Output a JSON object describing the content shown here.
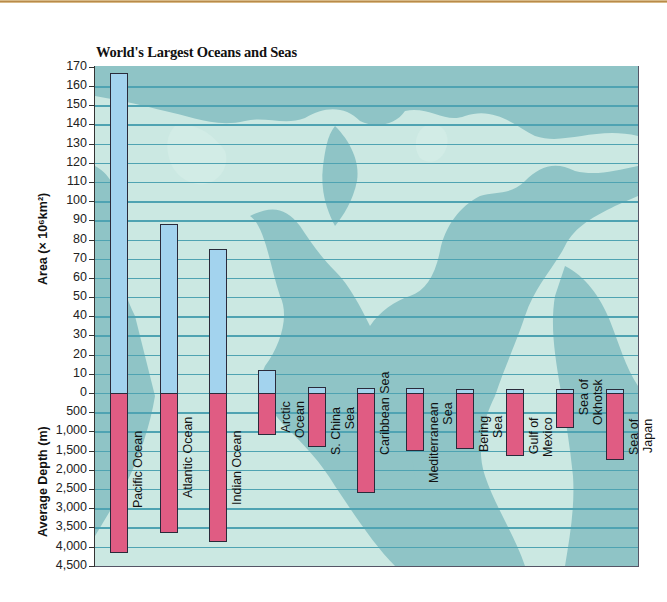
{
  "chart_data": {
    "type": "bar",
    "title": "World's Largest Oceans and Seas",
    "categories": [
      "Pacific Ocean",
      "Atlantic Ocean",
      "Indian Ocean",
      "Arctic Ocean",
      "S. China Sea",
      "Caribbean Sea",
      "Mediterranean Sea",
      "Bering Sea",
      "Gulf of Mexico",
      "Sea of Okhotsk",
      "Sea of Japan"
    ],
    "series": [
      {
        "name": "Area (×10^6 km²)",
        "color": "#a3d3ee",
        "values": [
          167,
          88,
          75,
          12,
          3,
          2.8,
          2.5,
          2.3,
          2.0,
          1.6,
          1.0
        ]
      },
      {
        "name": "Average Depth (m)",
        "color": "#e05c83",
        "values": [
          4170,
          3650,
          3880,
          1100,
          1400,
          2600,
          1500,
          1450,
          1650,
          900,
          1750
        ]
      }
    ],
    "xlabel": "",
    "ylabel_top": "Area (× 10⁶km²)",
    "ylabel_bottom": "Average Depth (m)",
    "ylim_area": [
      0,
      170
    ],
    "ylim_depth": [
      0,
      4500
    ],
    "area_ticks": [
      "170",
      "160",
      "150",
      "140",
      "130",
      "120",
      "110",
      "100",
      "90",
      "80",
      "70",
      "60",
      "50",
      "40",
      "30",
      "20",
      "10",
      "0"
    ],
    "depth_ticks": [
      "500",
      "1,000",
      "1,500",
      "2,000",
      "2,500",
      "3,000",
      "3,500",
      "4,000",
      "4,500"
    ],
    "grid": true,
    "background": "world map",
    "legend": "none"
  },
  "labels": {
    "title": "World's Largest Oceans and Seas",
    "area_axis": "Area (× 10⁶km²)",
    "depth_axis": "Average Depth (m)",
    "bars": [
      [
        "Pacific Ocean"
      ],
      [
        "Atlantic Ocean"
      ],
      [
        "Indian Ocean"
      ],
      [
        "Arctic",
        "Ocean"
      ],
      [
        "S. China",
        "Sea"
      ],
      [
        "Caribbean Sea"
      ],
      [
        "Mediterranean",
        "Sea"
      ],
      [
        "Bering",
        "Sea"
      ],
      [
        "Gulf of",
        "Mexico"
      ],
      [
        "Sea of",
        "Okhotsk"
      ],
      [
        "Sea of",
        "Japan"
      ]
    ]
  }
}
